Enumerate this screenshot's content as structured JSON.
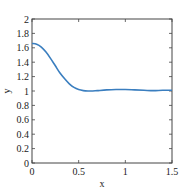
{
  "chart_data": {
    "type": "line",
    "title": "",
    "xlabel": "x",
    "ylabel": "y",
    "xlim": [
      0,
      1.5
    ],
    "ylim": [
      0,
      2
    ],
    "xticks": [
      0,
      0.5,
      1,
      1.5
    ],
    "xtick_labels": [
      "0",
      "0.5",
      "1",
      "1.5"
    ],
    "yticks": [
      0,
      0.2,
      0.4,
      0.6,
      0.8,
      1,
      1.2,
      1.4,
      1.6,
      1.8,
      2
    ],
    "ytick_labels": [
      "0",
      "0.2",
      "0.4",
      "0.6",
      "0.8",
      "1",
      "1.2",
      "1.4",
      "1.6",
      "1.8",
      "2"
    ],
    "grid": false,
    "legend": null,
    "series": [
      {
        "name": "y",
        "color": "#3a7ebf",
        "x": [
          0,
          0.05,
          0.1,
          0.15,
          0.2,
          0.25,
          0.3,
          0.35,
          0.4,
          0.45,
          0.5,
          0.55,
          0.6,
          0.65,
          0.7,
          0.8,
          0.9,
          1.0,
          1.1,
          1.2,
          1.3,
          1.4,
          1.5
        ],
        "y": [
          1.66,
          1.65,
          1.61,
          1.54,
          1.45,
          1.35,
          1.25,
          1.17,
          1.1,
          1.05,
          1.02,
          1.005,
          1.0,
          1.0,
          1.005,
          1.015,
          1.02,
          1.02,
          1.015,
          1.01,
          1.005,
          1.01,
          1.01
        ]
      }
    ]
  }
}
